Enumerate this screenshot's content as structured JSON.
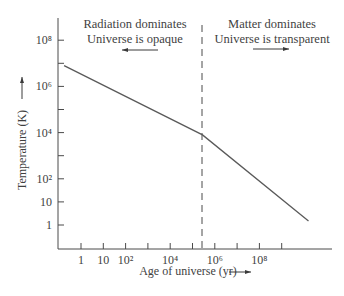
{
  "chart_data": {
    "type": "line",
    "title": "",
    "xlabel": "Age of universe (yr)",
    "ylabel": "Temperature (K)",
    "xscale": "log",
    "yscale": "log",
    "x_ticks": [
      {
        "label": "1",
        "exp": 0
      },
      {
        "label": "10",
        "exp": 1
      },
      {
        "label": "10²",
        "exp": 2
      },
      {
        "label": "",
        "exp": 3
      },
      {
        "label": "10⁴",
        "exp": 4
      },
      {
        "label": "",
        "exp": 5
      },
      {
        "label": "10⁶",
        "exp": 6
      },
      {
        "label": "",
        "exp": 7
      },
      {
        "label": "10⁸",
        "exp": 8
      },
      {
        "label": "",
        "exp": 9
      }
    ],
    "y_ticks": [
      {
        "label": "1",
        "exp": 0
      },
      {
        "label": "10",
        "exp": 1
      },
      {
        "label": "10²",
        "exp": 2
      },
      {
        "label": "",
        "exp": 3
      },
      {
        "label": "10⁴",
        "exp": 4
      },
      {
        "label": "",
        "exp": 5
      },
      {
        "label": "10⁶",
        "exp": 6
      },
      {
        "label": "",
        "exp": 7
      },
      {
        "label": "10⁸",
        "exp": 8
      }
    ],
    "series": [
      {
        "name": "Temperature of universe",
        "points_log10": [
          {
            "log_age_yr": -0.76,
            "log_temp_K": 6.9
          },
          {
            "log_age_yr": 5.45,
            "log_temp_K": 3.9
          },
          {
            "log_age_yr": 10.2,
            "log_temp_K": 0.17
          }
        ]
      }
    ],
    "annotations": [
      {
        "type": "vline",
        "style": "dashed",
        "log_age_yr": 5.55,
        "label": "Decoupling (~380,000 yr)"
      },
      {
        "type": "text",
        "lines": [
          "Radiation dominates",
          "Universe is opaque"
        ],
        "arrow": "left"
      },
      {
        "type": "text",
        "lines": [
          "Matter dominates",
          "Universe is transparent"
        ],
        "arrow": "right"
      }
    ],
    "grid": false,
    "legend": false
  },
  "labels": {
    "left_region": {
      "line1": "Radiation dominates",
      "line2": "Universe is opaque"
    },
    "right_region": {
      "line1": "Matter dominates",
      "line2": "Universe is transparent"
    },
    "x_axis": "Age of universe (yr)",
    "y_axis": "Temperature (K)"
  },
  "colors": {
    "axis": "#4a4a4a",
    "line": "#5a5a5a",
    "text": "#3f3f3f"
  }
}
